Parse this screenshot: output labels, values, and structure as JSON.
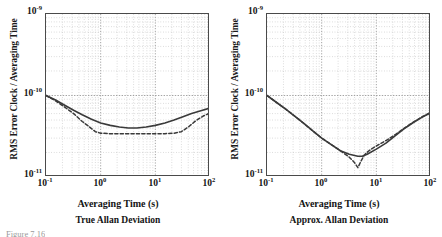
{
  "figure": {
    "caption_fragment": "Figure 7.16",
    "panels": [
      {
        "id": "true-allan",
        "subcaption": "True Allan Deviation",
        "xlabel": "Averaging Time (s)",
        "ylabel": "RMS Error Clock / Averaging Time",
        "yticks": [
          {
            "mant": "10",
            "exp": "-9"
          },
          {
            "mant": "10",
            "exp": "-10"
          },
          {
            "mant": "10",
            "exp": "-11"
          }
        ],
        "xticks": [
          {
            "mant": "10",
            "exp": "-1"
          },
          {
            "mant": "10",
            "exp": "0"
          },
          {
            "mant": "10",
            "exp": "1"
          },
          {
            "mant": "10",
            "exp": "2"
          }
        ]
      },
      {
        "id": "approx-allan",
        "subcaption": "Approx. Allan Deviation",
        "xlabel": "Averaging Time (s)",
        "ylabel": "RMS Error Clock / Averaging Time",
        "yticks": [
          {
            "mant": "10",
            "exp": "-9"
          },
          {
            "mant": "10",
            "exp": "-10"
          },
          {
            "mant": "10",
            "exp": "-11"
          }
        ],
        "xticks": [
          {
            "mant": "10",
            "exp": "-1"
          },
          {
            "mant": "10",
            "exp": "0"
          },
          {
            "mant": "10",
            "exp": "1"
          },
          {
            "mant": "10",
            "exp": "2"
          }
        ]
      }
    ]
  },
  "chart_data": [
    {
      "type": "line",
      "title": "True Allan Deviation",
      "xlabel": "Averaging Time (s)",
      "ylabel": "RMS Error Clock / Averaging Time",
      "xscale": "log",
      "yscale": "log",
      "xlim": [
        0.1,
        100
      ],
      "ylim": [
        1e-11,
        1e-09
      ],
      "grid": true,
      "legend": "none",
      "series": [
        {
          "name": "solid-curve",
          "style": "solid",
          "color": "#3a3a3a",
          "x": [
            0.1,
            0.15,
            0.22,
            0.32,
            0.46,
            0.68,
            1.0,
            1.5,
            2.2,
            3.2,
            4.6,
            6.8,
            10.0,
            15.0,
            22.0,
            32.0,
            46.0,
            68.0,
            100.0
          ],
          "y": [
            1e-10,
            8.8e-11,
            7.6e-11,
            6.6e-11,
            5.8e-11,
            5.1e-11,
            4.6e-11,
            4.3e-11,
            4.1e-11,
            4e-11,
            4e-11,
            4.1e-11,
            4.3e-11,
            4.6e-11,
            5e-11,
            5.5e-11,
            6e-11,
            6.5e-11,
            7e-11
          ]
        },
        {
          "name": "dashed-curve",
          "style": "dashed",
          "color": "#3a3a3a",
          "x": [
            0.1,
            0.15,
            0.22,
            0.32,
            0.46,
            0.6,
            0.8,
            1.0,
            1.5,
            2.2,
            3.2,
            4.6,
            6.8,
            10.0,
            15.0,
            22.0,
            30.0,
            40.0,
            55.0,
            75.0,
            100.0
          ],
          "y": [
            1e-10,
            8.6e-11,
            7.2e-11,
            6e-11,
            4.8e-11,
            4.2e-11,
            3.6e-11,
            3.45e-11,
            3.4e-11,
            3.4e-11,
            3.4e-11,
            3.4e-11,
            3.4e-11,
            3.4e-11,
            3.4e-11,
            3.45e-11,
            3.6e-11,
            4.1e-11,
            4.9e-11,
            5.6e-11,
            6.1e-11
          ]
        }
      ]
    },
    {
      "type": "line",
      "title": "Approx. Allan Deviation",
      "xlabel": "Averaging Time (s)",
      "ylabel": "RMS Error Clock / Averaging Time",
      "xscale": "log",
      "yscale": "log",
      "xlim": [
        0.1,
        100
      ],
      "ylim": [
        1e-11,
        1e-09
      ],
      "grid": true,
      "legend": "none",
      "series": [
        {
          "name": "solid-curve",
          "style": "solid",
          "color": "#3a3a3a",
          "x": [
            0.1,
            0.15,
            0.22,
            0.32,
            0.46,
            0.68,
            1.0,
            1.5,
            2.2,
            3.2,
            4.6,
            5.5,
            6.8,
            10.0,
            15.0,
            22.0,
            32.0,
            46.0,
            68.0,
            100.0
          ],
          "y": [
            1e-10,
            8.2e-11,
            6.8e-11,
            5.6e-11,
            4.6e-11,
            3.7e-11,
            3e-11,
            2.5e-11,
            2.1e-11,
            1.9e-11,
            1.8e-11,
            1.8e-11,
            1.9e-11,
            2.2e-11,
            2.6e-11,
            3.2e-11,
            3.9e-11,
            4.6e-11,
            5.4e-11,
            6.2e-11
          ]
        },
        {
          "name": "dashed-curve",
          "style": "dashed",
          "color": "#3a3a3a",
          "x": [
            0.1,
            0.15,
            0.22,
            0.32,
            0.46,
            0.68,
            1.0,
            1.5,
            2.2,
            3.2,
            4.0,
            4.6,
            5.2,
            6.0,
            7.0,
            8.5,
            10.0,
            15.0,
            22.0,
            32.0,
            46.0,
            68.0,
            100.0
          ],
          "y": [
            1e-10,
            8.2e-11,
            6.8e-11,
            5.6e-11,
            4.6e-11,
            3.7e-11,
            3e-11,
            2.5e-11,
            2.1e-11,
            1.75e-11,
            1.5e-11,
            1.3e-11,
            1.55e-11,
            1.85e-11,
            2.05e-11,
            2.25e-11,
            2.4e-11,
            2.8e-11,
            3.3e-11,
            3.95e-11,
            4.65e-11,
            5.45e-11,
            6.2e-11
          ]
        }
      ]
    }
  ]
}
